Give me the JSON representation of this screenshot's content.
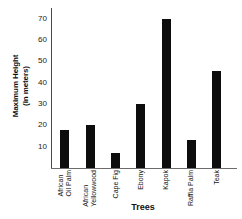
{
  "chart_data": {
    "type": "bar",
    "title": "",
    "xlabel": "Trees",
    "ylabel_line1": "Maximum Height",
    "ylabel_line2": "(in meters)",
    "ylabel": "Maximum Height (in meters)",
    "categories": [
      "African Oil Palm",
      "African Yellowwood",
      "Cape Fig",
      "Ebony",
      "Kapok",
      "Raffia Palm",
      "Teak"
    ],
    "category_lines": [
      [
        "African",
        "Oil Palm"
      ],
      [
        "African",
        "Yellowwood"
      ],
      [
        "Cape Fig"
      ],
      [
        "Ebony"
      ],
      [
        "Kapok"
      ],
      [
        "Raffia Palm"
      ],
      [
        "Teak"
      ]
    ],
    "values": [
      18,
      20,
      7,
      30,
      70,
      13,
      45.5
    ],
    "ylim": [
      0,
      75
    ],
    "yticks": [
      10,
      20,
      30,
      40,
      50,
      60,
      70
    ],
    "ytick_labels": [
      "10",
      "20",
      "30",
      "40",
      "50",
      "60",
      "70"
    ],
    "grid": false,
    "legend": false,
    "bar_color": "#0d0d0d",
    "axis_color": "#4a4a4a",
    "background": "#ffffff"
  }
}
